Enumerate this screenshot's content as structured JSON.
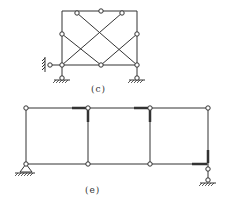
{
  "figures": [
    {
      "caption": "(c)",
      "description": "Rectangular frame with crossed diagonal members, hinges, fixed-wall roller on left and two pinned-roller supports at bottom"
    },
    {
      "caption": "(e)",
      "description": "Three-bay rectangular frame with hinges and rigid-joint markings, pin support at left and roller support at right"
    }
  ],
  "colors": {
    "line": "#333333",
    "background": "#ffffff"
  }
}
